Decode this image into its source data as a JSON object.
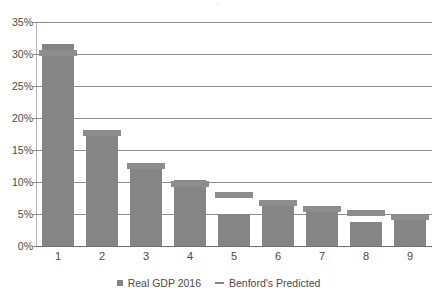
{
  "chart_data": {
    "type": "bar",
    "title": "",
    "xlabel": "",
    "ylabel": "",
    "categories": [
      "1",
      "2",
      "3",
      "4",
      "5",
      "6",
      "7",
      "8",
      "9"
    ],
    "ylim": [
      0,
      35
    ],
    "ytick_labels": [
      "0%",
      "5%",
      "10%",
      "15%",
      "20%",
      "25%",
      "30%",
      "35%"
    ],
    "ytick_values": [
      0,
      5,
      10,
      15,
      20,
      25,
      30,
      35
    ],
    "grid": true,
    "legend_position": "bottom",
    "series": [
      {
        "name": "Real GDP 2016",
        "type": "bar",
        "color": "#858585",
        "values": [
          31.5,
          17.6,
          12.5,
          10.3,
          5.0,
          6.9,
          5.9,
          3.7,
          4.6
        ]
      },
      {
        "name": "Benford's Predicted",
        "type": "marker-line",
        "color": "#8d8d8d",
        "values": [
          30.1,
          17.6,
          12.5,
          9.7,
          7.9,
          6.7,
          5.8,
          5.1,
          4.6
        ]
      }
    ]
  },
  "legend": {
    "items": [
      {
        "label": "Real GDP 2016",
        "marker": "square-swatch-icon"
      },
      {
        "label": "Benford's Predicted",
        "marker": "line-swatch-icon"
      }
    ]
  },
  "title_fragment": "."
}
